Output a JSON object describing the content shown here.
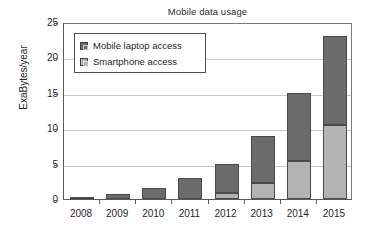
{
  "chart_data": {
    "type": "bar",
    "subtype": "stacked-bar",
    "title": "Mobile data usage",
    "xlabel": "",
    "ylabel": "ExaBytes/year",
    "categories": [
      "2008",
      "2009",
      "2010",
      "2011",
      "2012",
      "2013",
      "2014",
      "2015"
    ],
    "ylim": [
      0,
      25
    ],
    "ytick_labels": [
      "0",
      "5",
      "10",
      "15",
      "20",
      "25"
    ],
    "ytick_values": [
      0,
      5,
      10,
      15,
      20,
      25
    ],
    "grid": true,
    "grid_axis": "y",
    "legend_position": "upper left",
    "series": [
      {
        "name": "Smartphone access",
        "color": "#b3b3b3",
        "values": [
          0,
          0,
          0,
          0,
          0.8,
          2.2,
          5.3,
          10.4
        ]
      },
      {
        "name": "Mobile laptop access",
        "color": "#6b6b6b",
        "values": [
          0.2,
          0.65,
          1.6,
          3.0,
          4.2,
          6.7,
          9.7,
          12.6
        ]
      }
    ],
    "totals": [
      0.2,
      0.65,
      1.6,
      3.0,
      5.0,
      8.9,
      15.0,
      23.0
    ],
    "stack_order_bottom_to_top": [
      "Smartphone access",
      "Mobile laptop access"
    ]
  },
  "legend": {
    "entries": [
      {
        "label": "Mobile laptop access",
        "swatch": "dark-gray-swatch-icon",
        "color": "#6b6b6b"
      },
      {
        "label": "Smartphone access",
        "swatch": "light-gray-swatch-icon",
        "color": "#b3b3b3"
      }
    ]
  },
  "colors": {
    "background": "#ffffff",
    "axis": "#5a5a5a",
    "gridline": "#c9c9c9",
    "text": "#1f1f1f",
    "series_dark": "#6b6b6b",
    "series_light": "#b3b3b3",
    "bar_outline": "#4a4a4a"
  }
}
